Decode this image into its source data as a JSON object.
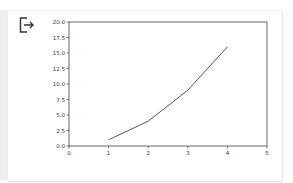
{
  "cell_output": {
    "icon": "output-redirect-icon"
  },
  "chart_data": {
    "type": "line",
    "title": "",
    "xlabel": "",
    "ylabel": "",
    "x": [
      1,
      2,
      3,
      4
    ],
    "series": [
      {
        "name": "",
        "values": [
          1,
          4,
          9,
          16
        ],
        "color": "#555555"
      }
    ],
    "xlim": [
      0,
      5
    ],
    "ylim": [
      0,
      20
    ],
    "xticks": [
      "0",
      "1",
      "2",
      "3",
      "4",
      "5"
    ],
    "yticks": [
      "0.0",
      "2.5",
      "5.0",
      "7.5",
      "10.0",
      "12.5",
      "15.0",
      "17.5",
      "20.0"
    ],
    "grid": false,
    "legend": null
  }
}
